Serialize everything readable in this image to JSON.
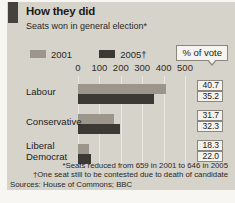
{
  "panel": {
    "title": "How they did",
    "subtitle": "Seats won in general election*",
    "vote_share_label": "% of vote",
    "legend": [
      {
        "label": "2001",
        "color": "#9b958b"
      },
      {
        "label": "2005†",
        "color": "#3c3834"
      }
    ],
    "footnotes": [
      "*Seats reduced from 659 in 2001 to 646 in 2005",
      "†One seat still to be contested due to death of candidate"
    ],
    "sources": "Sources: House of Commons; BBC"
  },
  "chart_data": {
    "type": "bar",
    "orientation": "horizontal",
    "title": "How they did",
    "subtitle": "Seats won in general election*",
    "categories": [
      "Labour",
      "Conservative",
      "Liberal Democrat"
    ],
    "series": [
      {
        "name": "2001",
        "color": "#9b958b",
        "values": [
          413,
          166,
          52
        ],
        "vote_share": [
          "40.7",
          "31.7",
          "18.3"
        ]
      },
      {
        "name": "2005†",
        "color": "#3c3834",
        "values": [
          355,
          198,
          62
        ],
        "vote_share": [
          "35.2",
          "32.3",
          "22.0"
        ]
      }
    ],
    "xlabel": "Seats won",
    "xlim": [
      0,
      500
    ],
    "xticks": [
      0,
      100,
      200,
      300,
      400,
      500
    ],
    "grid": true,
    "legend_position": "top",
    "annotation": "% of vote"
  },
  "colors": {
    "panel_bg": "#d6d3ca",
    "page_bg": "#f7f6f2",
    "brand_tab": "#45413d",
    "gridline": "#e9e7e0"
  }
}
